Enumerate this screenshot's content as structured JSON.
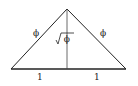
{
  "diagram": {
    "type": "golden-triangle",
    "labels": {
      "left_side": "ϕ",
      "right_side": "ϕ",
      "altitude": "√ϕ",
      "base_left": "1",
      "base_right": "1"
    },
    "colors": {
      "stroke": "#222222",
      "background": "#ffffff"
    }
  }
}
